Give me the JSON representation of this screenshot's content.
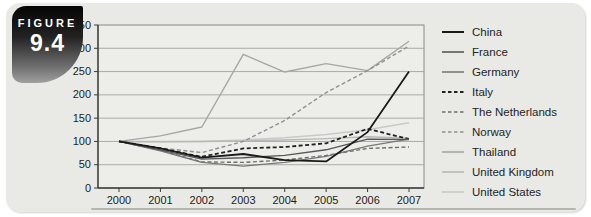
{
  "figure_badge": {
    "label": "FIGURE",
    "number": "9.4"
  },
  "chart_data": {
    "type": "line",
    "title": "",
    "xlabel": "",
    "ylabel": "",
    "x": [
      2000,
      2001,
      2002,
      2003,
      2004,
      2005,
      2006,
      2007
    ],
    "ylim": [
      0,
      350
    ],
    "ytick_step": 50,
    "grid": true,
    "legend_position": "right",
    "series": [
      {
        "name": "China",
        "color": "#1a1a1a",
        "dash": null,
        "width": 1.8,
        "values": [
          100,
          85,
          65,
          73,
          60,
          57,
          120,
          250
        ]
      },
      {
        "name": "France",
        "color": "#585858",
        "dash": null,
        "width": 1.4,
        "values": [
          100,
          82,
          62,
          65,
          70,
          82,
          105,
          104
        ]
      },
      {
        "name": "Germany",
        "color": "#787878",
        "dash": null,
        "width": 1.4,
        "values": [
          100,
          80,
          55,
          47,
          55,
          68,
          90,
          105
        ]
      },
      {
        "name": "Italy",
        "color": "#222222",
        "dash": "4,2.5",
        "width": 1.8,
        "values": [
          100,
          85,
          67,
          85,
          88,
          96,
          127,
          105
        ]
      },
      {
        "name": "The Netherlands",
        "color": "#6e6e6e",
        "dash": "4,2.5",
        "width": 1.4,
        "values": [
          100,
          81,
          56,
          55,
          60,
          70,
          85,
          88
        ]
      },
      {
        "name": "Norway",
        "color": "#909090",
        "dash": "4,2.5",
        "width": 1.4,
        "values": [
          100,
          86,
          76,
          100,
          145,
          205,
          252,
          305
        ]
      },
      {
        "name": "Thailand",
        "color": "#a6a6a6",
        "dash": null,
        "width": 1.4,
        "values": [
          100,
          112,
          131,
          287,
          249,
          267,
          252,
          315
        ]
      },
      {
        "name": "United Kingdom",
        "color": "#b8b8b8",
        "dash": null,
        "width": 1.4,
        "values": [
          100,
          99,
          100,
          101,
          103,
          106,
          110,
          107
        ]
      },
      {
        "name": "United States",
        "color": "#c9c9c9",
        "dash": null,
        "width": 1.4,
        "values": [
          100,
          100,
          100,
          103,
          108,
          115,
          125,
          140
        ]
      }
    ]
  },
  "styles": {
    "card_bg": "#e9eae6",
    "plot_bg": "#edeeea",
    "grid_color": "#a3a39f",
    "box_color": "#8a8a86",
    "axis_color": "#3c3c3c",
    "tick_text_color": "#1c1c1c",
    "rule_color": "#b4b6b2",
    "badge_top": "#050505",
    "badge_bottom": "#a0a0a0",
    "badge_text": "#ffffff",
    "legend_text_color": "#242424"
  }
}
